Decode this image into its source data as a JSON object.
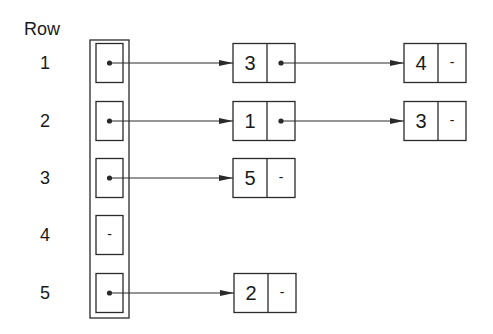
{
  "header": {
    "row_label": "Row"
  },
  "colors": {
    "stroke": "#2a2a2a",
    "text": "#1a1a1a",
    "background": "#ffffff"
  },
  "null_symbol": "-",
  "pointer_column": {
    "box": {
      "x": 90,
      "y": 40,
      "w": 39,
      "h": 278
    },
    "cell": {
      "x": 96,
      "w": 27,
      "h": 39
    }
  },
  "node_geometry": {
    "w": 62,
    "h": 39,
    "value_w": 34
  },
  "rows": [
    {
      "label": "1",
      "cy": 63,
      "has_pointer": true,
      "nodes": [
        {
          "value": "3",
          "x": 233,
          "next": true
        },
        {
          "value": "4",
          "x": 404,
          "next": false
        }
      ]
    },
    {
      "label": "2",
      "cy": 121,
      "has_pointer": true,
      "nodes": [
        {
          "value": "1",
          "x": 233,
          "next": true
        },
        {
          "value": "3",
          "x": 404,
          "next": false
        }
      ]
    },
    {
      "label": "3",
      "cy": 178,
      "has_pointer": true,
      "nodes": [
        {
          "value": "5",
          "x": 233,
          "next": false
        }
      ]
    },
    {
      "label": "4",
      "cy": 235,
      "has_pointer": false,
      "nodes": []
    },
    {
      "label": "5",
      "cy": 293,
      "has_pointer": true,
      "nodes": [
        {
          "value": "2",
          "x": 234,
          "next": false
        }
      ]
    }
  ]
}
